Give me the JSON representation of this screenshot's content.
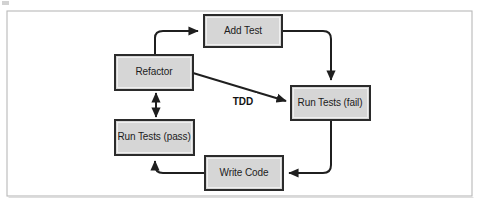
{
  "figure": {
    "type": "flow-diagram",
    "canvas": {
      "width": 479,
      "height": 205
    },
    "background_color": "#ffffff",
    "frame": {
      "name": "figure-border",
      "x": 7,
      "y": 11,
      "width": 465,
      "height": 185,
      "stroke_color": "#b9b9b9"
    }
  },
  "style": {
    "node_fill": "#d6d6d6",
    "node_stroke": "#2b2b2b",
    "edge_color": "#1f1f1f",
    "label_color": "#1c1c1c",
    "edge_label_color": "#121212"
  },
  "nodes": [
    {
      "id": "add-test",
      "label": "Add Test",
      "x": 204,
      "y": 15,
      "width": 78,
      "height": 32,
      "cx": 243,
      "cy": 31
    },
    {
      "id": "refactor",
      "label": "Refactor",
      "x": 115,
      "y": 55,
      "width": 78,
      "height": 35,
      "cx": 154,
      "cy": 72
    },
    {
      "id": "run-tests-fail",
      "label": "Run Tests (fail)",
      "x": 291,
      "y": 86,
      "width": 79,
      "height": 34,
      "cx": 330,
      "cy": 103
    },
    {
      "id": "run-tests-pass",
      "label": "Run Tests (pass)",
      "x": 115,
      "y": 120,
      "width": 79,
      "height": 35,
      "cx": 154,
      "cy": 137
    },
    {
      "id": "write-code",
      "label": "Write Code",
      "x": 205,
      "y": 156,
      "width": 78,
      "height": 34,
      "cx": 244,
      "cy": 173
    }
  ],
  "edges": [
    {
      "id": "refactor-to-add-test",
      "from": "refactor",
      "to": "add-test",
      "label": "",
      "arrow": "single",
      "path": "M 155 55 L 155 38 Q 155 31 163 31 L 198 31"
    },
    {
      "id": "add-test-to-run-tests-fail",
      "from": "add-test",
      "to": "run-tests-fail",
      "label": "",
      "arrow": "single",
      "path": "M 282 31 L 323 31 Q 331 31 331 39 L 331 80"
    },
    {
      "id": "run-tests-fail-to-write-code",
      "from": "run-tests-fail",
      "to": "write-code",
      "label": "",
      "arrow": "single",
      "path": "M 331 120 L 331 165 Q 331 173 323 173 L 289 173"
    },
    {
      "id": "write-code-to-run-tests-pass",
      "from": "write-code",
      "to": "run-tests-pass",
      "label": "",
      "arrow": "single",
      "path": "M 205 173 L 163 173 Q 155 173 155 165 L 155 161"
    },
    {
      "id": "refactor-run-tests-pass-bidirectional",
      "from": "refactor",
      "to": "run-tests-pass",
      "label": "",
      "arrow": "double",
      "path": "M 156 93 L 156 117"
    },
    {
      "id": "refactor-to-run-tests-fail-tdd",
      "from": "refactor",
      "to": "run-tests-fail",
      "label": "TDD",
      "arrow": "single",
      "path": "M 193 73 L 286 101",
      "label_x": 243,
      "label_y": 101
    }
  ]
}
